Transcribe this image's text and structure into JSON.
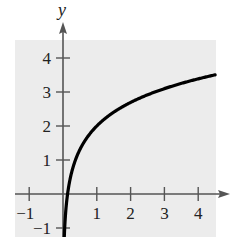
{
  "chart_data": {
    "type": "line",
    "title": "",
    "xlabel": "",
    "ylabel": "y",
    "xlim": [
      -1.4,
      4.6
    ],
    "ylim": [
      -1.2,
      4.6
    ],
    "grid": false,
    "legend": null,
    "x_ticks": [
      -1,
      1,
      2,
      3,
      4
    ],
    "y_ticks": [
      -1,
      1,
      2,
      3,
      4
    ],
    "x_tick_labels": [
      "-1",
      "1",
      "2",
      "3",
      "4"
    ],
    "y_tick_labels": [
      "-1",
      "1",
      "2",
      "3",
      "4"
    ],
    "series": [
      {
        "name": "y = 2 + ln x",
        "x": [
          0.1,
          0.135,
          0.2,
          0.3,
          0.5,
          0.75,
          1,
          1.5,
          2,
          2.5,
          3,
          3.5,
          4,
          4.5
        ],
        "values": [
          -0.3,
          0.0,
          0.39,
          0.8,
          1.31,
          1.71,
          2.0,
          2.41,
          2.69,
          2.92,
          3.1,
          3.25,
          3.39,
          3.5
        ]
      }
    ],
    "colors": {
      "background_panel": "#ececec",
      "axis": "#555555",
      "curve": "#000000"
    }
  }
}
